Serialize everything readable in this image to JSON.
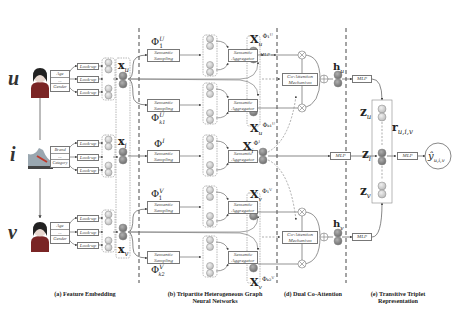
{
  "entities": {
    "user": {
      "symbol": "u",
      "icon": "user-avatar-icon",
      "attributes": [
        "Age",
        "...",
        "Gender"
      ]
    },
    "item": {
      "symbol": "i",
      "icon": "shoe-icon",
      "attributes": [
        "Brand",
        "...",
        "Category"
      ]
    },
    "sharer": {
      "symbol": "v",
      "icon": "user-avatar-icon",
      "attributes": [
        "Age",
        "...",
        "Gender"
      ]
    }
  },
  "labels": {
    "lookup": "Look-up",
    "semantic_sampling": [
      "Semantic",
      "Sampling"
    ],
    "semantic_aggregator": [
      "Semantic",
      "Aggregator"
    ],
    "mlp": "MLP",
    "coattention": [
      "Co-Attention",
      "Mechanism"
    ],
    "ellipsis": "...",
    "vdots": "⋮"
  },
  "vectors": {
    "xu": "x",
    "xu_sub": "u",
    "xi": "x",
    "xi_sub": "i",
    "xv": "x",
    "xv_sub": "v",
    "phi_u1": "Φ",
    "phi_u1_sup": "U",
    "phi_u1_sub": "1",
    "phi_uk": "Φ",
    "phi_uk_sup": "U",
    "phi_uk_sub": "k1",
    "phi_i": "Φ",
    "phi_i_sup": "I",
    "phi_v1": "Φ",
    "phi_v1_sup": "V",
    "phi_v1_sub": "1",
    "phi_vk": "Φ",
    "phi_vk_sup": "V",
    "phi_vk_sub": "k2",
    "X_u1": "X",
    "X_u1_sub": "u",
    "X_u1_sup": "Φ₁ᵁ",
    "X_uk": "X",
    "X_uk_sub": "u",
    "X_uk_sup": "Φₖ₁ᵁ",
    "X_i": "X",
    "X_i_sub": "i",
    "X_i_sup": "Φᴵ",
    "X_v1": "X",
    "X_v1_sub": "v",
    "X_v1_sup": "Φ₁ⱽ",
    "X_vk": "X",
    "X_vk_sub": "v",
    "X_vk_sup": "Φₖ₂ⱽ",
    "h_u": "h",
    "h_u_sub": "u",
    "h_v": "h",
    "h_v_sub": "v",
    "z_u": "z",
    "z_u_sub": "u",
    "z_i": "z",
    "z_i_sub": "i",
    "z_v": "z",
    "z_v_sub": "v",
    "r": "r",
    "r_sub": "u,i,v",
    "y": "ŷ",
    "y_sub": "u,i,v"
  },
  "captions": {
    "a": "(a) Feature Embedding",
    "b1": "(b) Tripartite Heterogeneous Graph",
    "b2": "Neural Networks",
    "d": "(d) Dual Co-Attention",
    "e1": "(e) Transitive Triplet",
    "e2": "Representation"
  },
  "colors": {
    "node_light": "#d6d6d6",
    "node_dark": "#8a8a8a",
    "line": "#555555",
    "dash": "#333333"
  }
}
